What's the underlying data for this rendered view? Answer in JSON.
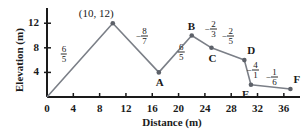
{
  "chart_data": {
    "type": "line",
    "title": "",
    "xlabel": "Distance (m)",
    "ylabel": "Elevation (m)",
    "xlim": [
      0,
      38
    ],
    "ylim": [
      0,
      13.5
    ],
    "xticks": [
      0,
      4,
      8,
      12,
      16,
      20,
      24,
      28,
      32,
      36
    ],
    "xtick_labels": [
      "0",
      "4",
      "8",
      "12",
      "16",
      "20",
      "24",
      "28",
      "32",
      "36"
    ],
    "yticks": [
      4,
      8,
      12
    ],
    "ytick_labels": [
      "4",
      "8",
      "12"
    ],
    "grid": false,
    "legend": null,
    "series": [
      {
        "name": "Elevation profile",
        "x": [
          0,
          10,
          17,
          22,
          25,
          30,
          31,
          37
        ],
        "y": [
          0,
          12,
          4,
          10,
          8,
          6,
          2,
          1.3
        ]
      }
    ],
    "point_labels": [
      {
        "point_index": 1,
        "text": "(10, 12)",
        "position": "above-left"
      },
      {
        "point_index": 2,
        "text": "A",
        "position": "below"
      },
      {
        "point_index": 3,
        "text": "B",
        "position": "above"
      },
      {
        "point_index": 4,
        "text": "C",
        "position": "below"
      },
      {
        "point_index": 5,
        "text": "D",
        "position": "above-right"
      },
      {
        "point_index": 6,
        "text": "E",
        "position": "below-left"
      },
      {
        "point_index": 7,
        "text": "F",
        "position": "above-right"
      }
    ],
    "segment_slopes": [
      {
        "from": 0,
        "to": 1,
        "sign": "",
        "numerator": "6",
        "denominator": "5"
      },
      {
        "from": 1,
        "to": 2,
        "sign": "−",
        "numerator": "8",
        "denominator": "7"
      },
      {
        "from": 2,
        "to": 3,
        "sign": "",
        "numerator": "6",
        "denominator": "5"
      },
      {
        "from": 3,
        "to": 4,
        "sign": "−",
        "numerator": "2",
        "denominator": "3"
      },
      {
        "from": 4,
        "to": 5,
        "sign": "−",
        "numerator": "2",
        "denominator": "5"
      },
      {
        "from": 5,
        "to": 6,
        "sign": "−",
        "numerator": "4",
        "denominator": "1"
      },
      {
        "from": 6,
        "to": 7,
        "sign": "−",
        "numerator": "1",
        "denominator": "6"
      }
    ],
    "colors": {
      "line": "#7b7f87",
      "marker": "#5d6169",
      "axis": "#1a1a1a",
      "text": "#1a1a1a",
      "background": "#ffffff"
    }
  },
  "axes": {
    "x_title": "Distance (m)",
    "y_title": "Elevation (m)"
  },
  "ticks": {
    "x": [
      "0",
      "4",
      "8",
      "12",
      "16",
      "20",
      "24",
      "28",
      "32",
      "36"
    ],
    "y": [
      "4",
      "8",
      "12"
    ]
  },
  "annotations": {
    "coordinate": "(10, 12)",
    "points": [
      "A",
      "B",
      "C",
      "D",
      "E",
      "F"
    ],
    "slopes": [
      {
        "sign": "",
        "num": "6",
        "den": "5"
      },
      {
        "sign": "−",
        "num": "8",
        "den": "7"
      },
      {
        "sign": "",
        "num": "6",
        "den": "5"
      },
      {
        "sign": "−",
        "num": "2",
        "den": "3"
      },
      {
        "sign": "−",
        "num": "2",
        "den": "5"
      },
      {
        "sign": "−",
        "num": "4",
        "den": "1"
      },
      {
        "sign": "−",
        "num": "1",
        "den": "6"
      }
    ]
  }
}
